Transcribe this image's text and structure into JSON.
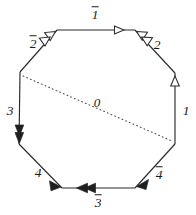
{
  "figure": {
    "background_color": "#ffffff",
    "line_color": "#2b2b2b",
    "chord_color": "#555555",
    "width": 196,
    "height": 215,
    "vertices": [
      {
        "name": "top-left",
        "x": 57,
        "y": 30
      },
      {
        "name": "top-right",
        "x": 135,
        "y": 30
      },
      {
        "name": "right-upper",
        "x": 175,
        "y": 73
      },
      {
        "name": "right-lower",
        "x": 175,
        "y": 144
      },
      {
        "name": "bottom-right",
        "x": 135,
        "y": 188
      },
      {
        "name": "bottom-left",
        "x": 62,
        "y": 188
      },
      {
        "name": "left-lower",
        "x": 19,
        "y": 144
      },
      {
        "name": "left-upper",
        "x": 20,
        "y": 72
      }
    ],
    "edges": [
      {
        "id": "edge-top",
        "label": "1",
        "barred": true,
        "label_x": 95,
        "label_y": 14,
        "arrow_style": "open",
        "arrow_count": 2,
        "direction": "right"
      },
      {
        "id": "edge-upper-right",
        "label": "2",
        "barred": false,
        "label_x": 157,
        "label_y": 44,
        "arrow_style": "open",
        "arrow_count": 2,
        "direction": "up-left"
      },
      {
        "id": "edge-right",
        "label": "1",
        "barred": false,
        "label_x": 186,
        "label_y": 110,
        "arrow_style": "open",
        "arrow_count": 1,
        "direction": "up"
      },
      {
        "id": "edge-lower-right",
        "label": "4",
        "barred": true,
        "label_x": 159,
        "label_y": 174,
        "arrow_style": "solid",
        "arrow_count": 1,
        "direction": "down-left"
      },
      {
        "id": "edge-bottom",
        "label": "3",
        "barred": true,
        "label_x": 98,
        "label_y": 202,
        "arrow_style": "solid",
        "arrow_count": 2,
        "direction": "left"
      },
      {
        "id": "edge-lower-left",
        "label": "4",
        "barred": false,
        "label_x": 38,
        "label_y": 172,
        "arrow_style": "solid",
        "arrow_count": 1,
        "direction": "down-right"
      },
      {
        "id": "edge-left",
        "label": "3",
        "barred": false,
        "label_x": 10,
        "label_y": 110,
        "arrow_style": "solid",
        "arrow_count": 2,
        "direction": "down"
      },
      {
        "id": "edge-upper-left",
        "label": "2",
        "barred": true,
        "label_x": 33,
        "label_y": 43,
        "arrow_style": "open",
        "arrow_count": 2,
        "direction": "up-right"
      }
    ],
    "chord": {
      "id": "chord-diagonal",
      "label": "0",
      "label_x": 97,
      "label_y": 102,
      "style": "dotted",
      "from": "left-upper",
      "to": "right-lower"
    }
  }
}
